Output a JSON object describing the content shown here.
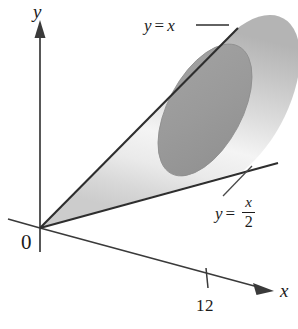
{
  "figure": {
    "background_color": "#ffffff",
    "ink_color": "#1b1b1b",
    "cone_fill_light": "#f2f2f2",
    "cone_fill_mid": "#c9c9c9",
    "cap_fill": "#9a9a9a",
    "cap_stroke": "#8a8a8a"
  },
  "axes": {
    "y_axis": {
      "label": "y",
      "arrow": "up-arrowhead"
    },
    "x_axis": {
      "label": "x",
      "arrow": "right-arrowhead"
    },
    "origin": {
      "label": "0"
    },
    "ticks": [
      {
        "label": "12",
        "axis": "x"
      }
    ]
  },
  "annotations": [
    {
      "id": "upper-bound",
      "lhs": "y",
      "equals": "=",
      "rhs": "x",
      "text": "y = x",
      "leader": "horizontal-dash"
    },
    {
      "id": "lower-bound",
      "lhs": "y",
      "equals": "=",
      "numerator": "x",
      "denominator": "2",
      "text": "y = x/2",
      "leader": "diagonal-line"
    }
  ]
}
